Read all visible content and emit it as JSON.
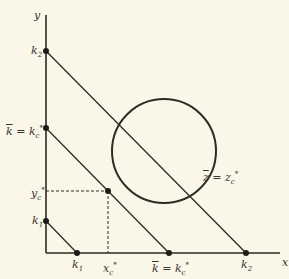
{
  "diagram": {
    "axes": {
      "x_label": "x",
      "y_label": "y"
    },
    "colors": {
      "background": "#fbf7e8",
      "ink": "#2e2a26"
    },
    "labels": {
      "k2_y": {
        "base": "k",
        "sub": "2"
      },
      "kbar_y": {
        "left": "k",
        "eq": "=",
        "base": "k",
        "sub": "c",
        "sup": "*"
      },
      "yc_star": {
        "base": "y",
        "sub": "c",
        "sup": "*"
      },
      "k1_y": {
        "base": "k",
        "sub": "1"
      },
      "k1_x": {
        "base": "k",
        "sub": "1"
      },
      "xc_star": {
        "base": "x",
        "sub": "c",
        "sup": "*"
      },
      "kbar_x": {
        "left": "k",
        "eq": "=",
        "base": "k",
        "sub": "c",
        "sup": "*"
      },
      "k2_x": {
        "base": "k",
        "sub": "2"
      },
      "zbar": {
        "left": "z",
        "eq": "=",
        "base": "z",
        "sub": "c",
        "sup": "*"
      }
    },
    "lines": [
      {
        "name": "budget-line-k1",
        "from": [
          46,
          221
        ],
        "to": [
          77,
          253
        ]
      },
      {
        "name": "budget-line-kc",
        "from": [
          46,
          128
        ],
        "to": [
          169,
          253
        ]
      },
      {
        "name": "budget-line-k2",
        "from": [
          46,
          51
        ],
        "to": [
          246,
          253
        ]
      }
    ],
    "circle": {
      "cx": 164,
      "cy": 151,
      "r": 52
    },
    "tangent_point": {
      "x": 108,
      "y": 191
    }
  }
}
